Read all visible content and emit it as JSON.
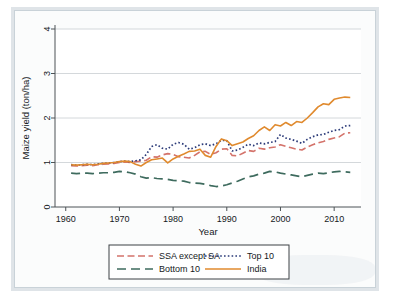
{
  "chart_data": {
    "type": "line",
    "title": "",
    "xlabel": "Year",
    "ylabel": "Maize yield (ton/ha)",
    "xlim": [
      1958,
      2015
    ],
    "ylim": [
      0,
      4
    ],
    "xticks": [
      1960,
      1970,
      1980,
      1990,
      2000,
      2010
    ],
    "yticks": [
      0,
      1,
      2,
      3,
      4
    ],
    "grid": "horizontal",
    "legend_position": "bottom-outside",
    "legend_columns": 2,
    "x": [
      1961,
      1962,
      1963,
      1964,
      1965,
      1966,
      1967,
      1968,
      1969,
      1970,
      1971,
      1972,
      1973,
      1974,
      1975,
      1976,
      1977,
      1978,
      1979,
      1980,
      1981,
      1982,
      1983,
      1984,
      1985,
      1986,
      1987,
      1988,
      1989,
      1990,
      1991,
      1992,
      1993,
      1994,
      1995,
      1996,
      1997,
      1998,
      1999,
      2000,
      2001,
      2002,
      2003,
      2004,
      2005,
      2006,
      2007,
      2008,
      2009,
      2010,
      2011,
      2012,
      2013
    ],
    "series": [
      {
        "name": "SSA except SA",
        "color": "#d4736b",
        "dash": "medium-dash",
        "style": "dashed",
        "width": 1.6,
        "values": [
          0.93,
          0.92,
          0.93,
          0.94,
          0.93,
          0.95,
          0.96,
          0.97,
          0.98,
          1.0,
          1.01,
          1.0,
          1.02,
          1.03,
          1.05,
          1.13,
          1.12,
          1.17,
          1.2,
          1.18,
          1.13,
          1.12,
          1.1,
          1.16,
          1.24,
          1.25,
          1.18,
          1.22,
          1.3,
          1.31,
          1.16,
          1.15,
          1.21,
          1.27,
          1.25,
          1.32,
          1.3,
          1.33,
          1.35,
          1.4,
          1.36,
          1.33,
          1.3,
          1.28,
          1.35,
          1.4,
          1.44,
          1.47,
          1.52,
          1.55,
          1.58,
          1.66,
          1.67
        ]
      },
      {
        "name": "Top 10",
        "color": "#2b3a78",
        "dash": "dotted",
        "style": "dotted",
        "width": 1.7,
        "values": [
          0.95,
          0.94,
          0.95,
          0.96,
          0.95,
          0.97,
          0.98,
          0.99,
          1.0,
          1.02,
          1.03,
          1.02,
          1.04,
          1.06,
          1.18,
          1.36,
          1.4,
          1.32,
          1.3,
          1.41,
          1.45,
          1.41,
          1.3,
          1.33,
          1.4,
          1.42,
          1.38,
          1.42,
          1.5,
          1.49,
          1.26,
          1.28,
          1.34,
          1.41,
          1.38,
          1.44,
          1.42,
          1.45,
          1.47,
          1.63,
          1.55,
          1.52,
          1.48,
          1.43,
          1.52,
          1.58,
          1.62,
          1.63,
          1.68,
          1.72,
          1.74,
          1.82,
          1.83
        ]
      },
      {
        "name": "Bottom 10",
        "color": "#3e6b5e",
        "dash": "long-dash",
        "style": "long-dashed",
        "width": 1.7,
        "values": [
          0.76,
          0.75,
          0.76,
          0.76,
          0.75,
          0.76,
          0.77,
          0.77,
          0.78,
          0.8,
          0.79,
          0.77,
          0.74,
          0.68,
          0.65,
          0.66,
          0.64,
          0.63,
          0.62,
          0.6,
          0.59,
          0.58,
          0.55,
          0.54,
          0.53,
          0.51,
          0.48,
          0.46,
          0.47,
          0.5,
          0.54,
          0.58,
          0.63,
          0.68,
          0.7,
          0.74,
          0.76,
          0.8,
          0.79,
          0.76,
          0.74,
          0.72,
          0.7,
          0.68,
          0.71,
          0.74,
          0.76,
          0.75,
          0.77,
          0.79,
          0.8,
          0.79,
          0.78
        ]
      },
      {
        "name": "India",
        "color": "#e08a2e",
        "dash": "solid",
        "style": "solid",
        "width": 1.6,
        "values": [
          0.95,
          0.94,
          0.95,
          0.96,
          0.95,
          0.96,
          0.98,
          0.99,
          1.0,
          1.02,
          1.03,
          1.02,
          0.96,
          0.92,
          1.0,
          1.06,
          1.08,
          1.1,
          0.99,
          1.08,
          1.14,
          1.19,
          1.25,
          1.26,
          1.3,
          1.16,
          1.12,
          1.36,
          1.53,
          1.49,
          1.38,
          1.42,
          1.46,
          1.54,
          1.6,
          1.72,
          1.8,
          1.72,
          1.85,
          1.82,
          1.9,
          1.83,
          1.92,
          1.9,
          2.0,
          2.12,
          2.25,
          2.32,
          2.3,
          2.42,
          2.45,
          2.47,
          2.46
        ]
      }
    ]
  },
  "legend": {
    "items": [
      {
        "label": "SSA except SA"
      },
      {
        "label": "Top 10"
      },
      {
        "label": "Bottom 10"
      },
      {
        "label": "India"
      }
    ]
  }
}
